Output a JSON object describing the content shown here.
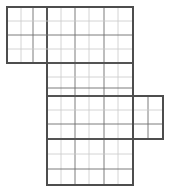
{
  "figure": {
    "type": "orthogonal-grid-net",
    "canvas": {
      "width": 172,
      "height": 191,
      "background": "#ffffff"
    },
    "unit_cell_px": 14,
    "origin": {
      "x": 7,
      "y": 7
    },
    "colors": {
      "outline": "#4d4d4d",
      "cell_line_dark": "#6e6e6e",
      "cell_line_light": "#c9c9c9",
      "seam_line": "#545454",
      "background": "#ffffff"
    },
    "stroke_widths": {
      "outline": 1.8,
      "seam": 1.3,
      "cell_dark": 0.9,
      "cell_light": 0.8
    },
    "blocks": [
      {
        "name": "top-block",
        "label": "top-left wide block",
        "x": 7,
        "y": 7,
        "cols": 9,
        "rows": 4,
        "x_end": 133,
        "y_end": 63
      },
      {
        "name": "main-column-block",
        "label": "central tall column",
        "x": 47,
        "y": 7,
        "cols": 6,
        "rows": 12.7,
        "x_end": 133,
        "y_end": 185
      },
      {
        "name": "right-extension-block",
        "label": "right side flap",
        "x": 133,
        "y": 96,
        "cols": 2,
        "rows": 3,
        "x_end": 163,
        "y_end": 139
      }
    ],
    "outline_path": "M 7 7 L 133 7 L 133 96 L 163 96 L 163 139 L 133 139 L 133 185 L 47 185 L 47 63 L 7 63 Z",
    "vertical_lines": [
      {
        "name": "v-7",
        "x": 7,
        "y1": 7,
        "y2": 63,
        "weight": "outline"
      },
      {
        "name": "v-21",
        "x": 21,
        "y1": 7,
        "y2": 63,
        "weight": "cell_light"
      },
      {
        "name": "v-33",
        "x": 33,
        "y1": 7,
        "y2": 63,
        "weight": "cell_dark"
      },
      {
        "name": "v-47",
        "x": 47,
        "y1": 7,
        "y2": 185,
        "weight": "seam"
      },
      {
        "name": "v-61",
        "x": 61,
        "y1": 7,
        "y2": 185,
        "weight": "cell_light"
      },
      {
        "name": "v-75",
        "x": 75,
        "y1": 7,
        "y2": 185,
        "weight": "cell_dark"
      },
      {
        "name": "v-89",
        "x": 89,
        "y1": 7,
        "y2": 185,
        "weight": "cell_light"
      },
      {
        "name": "v-104",
        "x": 104,
        "y1": 7,
        "y2": 185,
        "weight": "cell_dark"
      },
      {
        "name": "v-118",
        "x": 118,
        "y1": 7,
        "y2": 185,
        "weight": "cell_light"
      },
      {
        "name": "v-133",
        "x": 133,
        "y1": 7,
        "y2": 185,
        "weight": "outline"
      },
      {
        "name": "v-148",
        "x": 148,
        "y1": 96,
        "y2": 139,
        "weight": "cell_dark"
      },
      {
        "name": "v-163",
        "x": 163,
        "y1": 96,
        "y2": 139,
        "weight": "outline"
      }
    ],
    "horizontal_lines": [
      {
        "name": "h-7",
        "y": 7,
        "x1": 7,
        "x2": 133,
        "weight": "outline"
      },
      {
        "name": "h-21",
        "y": 21,
        "x1": 7,
        "x2": 133,
        "weight": "cell_light"
      },
      {
        "name": "h-35",
        "y": 35,
        "x1": 7,
        "x2": 133,
        "weight": "cell_dark"
      },
      {
        "name": "h-49",
        "y": 49,
        "x1": 7,
        "x2": 133,
        "weight": "cell_light"
      },
      {
        "name": "h-63",
        "y": 63,
        "x1": 7,
        "x2": 133,
        "weight": "seam"
      },
      {
        "name": "h-77",
        "y": 77,
        "x1": 47,
        "x2": 133,
        "weight": "cell_light"
      },
      {
        "name": "h-88",
        "y": 88,
        "x1": 47,
        "x2": 133,
        "weight": "cell_dark"
      },
      {
        "name": "h-96",
        "y": 96,
        "x1": 47,
        "x2": 163,
        "weight": "seam"
      },
      {
        "name": "h-110",
        "y": 110,
        "x1": 47,
        "x2": 163,
        "weight": "cell_light"
      },
      {
        "name": "h-124",
        "y": 124,
        "x1": 47,
        "x2": 163,
        "weight": "cell_dark"
      },
      {
        "name": "h-139",
        "y": 139,
        "x1": 47,
        "x2": 163,
        "weight": "seam"
      },
      {
        "name": "h-154",
        "y": 154,
        "x1": 47,
        "x2": 133,
        "weight": "cell_light"
      },
      {
        "name": "h-169",
        "y": 169,
        "x1": 47,
        "x2": 133,
        "weight": "cell_dark"
      },
      {
        "name": "h-185",
        "y": 185,
        "x1": 47,
        "x2": 133,
        "weight": "outline"
      }
    ]
  }
}
